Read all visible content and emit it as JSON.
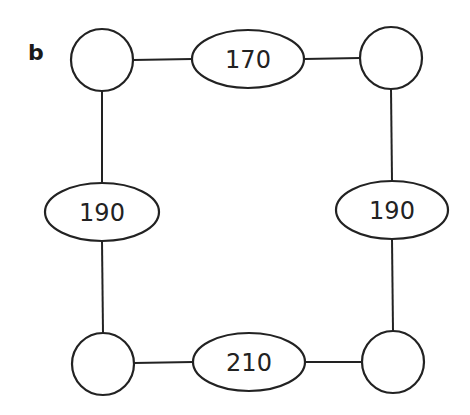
{
  "panel_label": "b",
  "colors": {
    "stroke": "#222222",
    "background": "#ffffff"
  },
  "nodes": [
    {
      "id": "top-left",
      "cx": 102,
      "cy": 60,
      "r": 31
    },
    {
      "id": "top-right",
      "cx": 391,
      "cy": 58,
      "r": 31
    },
    {
      "id": "bottom-left",
      "cx": 103,
      "cy": 364,
      "r": 31
    },
    {
      "id": "bottom-right",
      "cx": 393,
      "cy": 362,
      "r": 31
    }
  ],
  "edges": [
    {
      "id": "top",
      "from": "top-left",
      "to": "top-right",
      "weight": "170",
      "cx": 248,
      "cy": 59,
      "rx": 56,
      "ry": 29
    },
    {
      "id": "left",
      "from": "top-left",
      "to": "bottom-left",
      "weight": "190",
      "cx": 102,
      "cy": 212,
      "rx": 57,
      "ry": 29
    },
    {
      "id": "right",
      "from": "top-right",
      "to": "bottom-right",
      "weight": "190",
      "cx": 392,
      "cy": 210,
      "rx": 56,
      "ry": 29
    },
    {
      "id": "bottom",
      "from": "bottom-left",
      "to": "bottom-right",
      "weight": "210",
      "cx": 249,
      "cy": 362,
      "rx": 56,
      "ry": 29
    }
  ]
}
